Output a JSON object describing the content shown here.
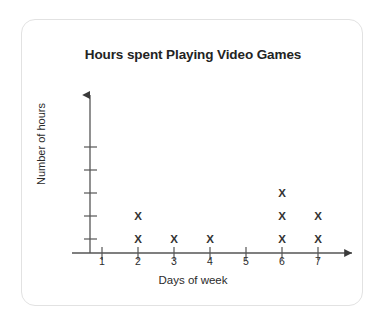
{
  "chart_data": {
    "type": "scatter",
    "title": "Hours spent Playing Video Games",
    "xlabel": "Days of week",
    "ylabel": "Number of hours",
    "marker": "X",
    "categories": [
      "1",
      "2",
      "3",
      "4",
      "5",
      "6",
      "7"
    ],
    "values": [
      0,
      2,
      1,
      1,
      0,
      3,
      2
    ],
    "xtick_labels": [
      "1",
      "2",
      "3",
      "4",
      "5",
      "6",
      "7"
    ],
    "ytick_labels": [
      "",
      "",
      "",
      "",
      ""
    ],
    "ytick_count": 5,
    "xlim": [
      0.5,
      7.5
    ],
    "ylim": [
      0,
      5
    ],
    "grid": false,
    "legend": false,
    "axis_arrows": true,
    "colors": {
      "marker": "#333333",
      "axis": "#555555",
      "title": "#232323",
      "card_border": "#e2e2e2",
      "background": "#ffffff"
    }
  }
}
